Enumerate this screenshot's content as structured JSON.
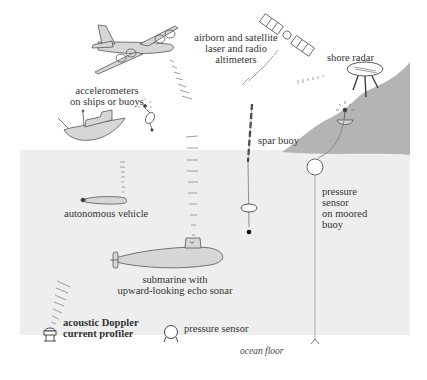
{
  "colors": {
    "ocean": "#eeeeee",
    "land": "#b4b4b4",
    "object_fill": "#d6d6d6",
    "outline": "#555555",
    "text": "#333333"
  },
  "labels": {
    "airborne": "airborn and satellite\nlaser and radio\naltimeters",
    "shore_radar": "shore radar",
    "accelerometers": "accelerometers\non ships or buoys",
    "spar_buoy": "spar buoy",
    "autonomous_vehicle": "autonomous vehicle",
    "pressure_moored": "pressure\nsensor\non moored\nbuoy",
    "submarine": "submarine with\nupward-looking echo sonar",
    "adcp": "acoustic Doppler\ncurrent profiler",
    "pressure_sensor": "pressure sensor",
    "ocean_floor": "ocean floor"
  },
  "objects": [
    {
      "name": "airplane",
      "icon": "airplane-icon"
    },
    {
      "name": "satellite",
      "icon": "satellite-icon"
    },
    {
      "name": "shore-radar",
      "icon": "radar-dish-icon"
    },
    {
      "name": "ship",
      "icon": "ship-icon"
    },
    {
      "name": "small-buoy",
      "icon": "buoy-icon"
    },
    {
      "name": "spar-buoy",
      "icon": "spar-buoy-icon"
    },
    {
      "name": "moored-buoy",
      "icon": "moored-buoy-icon"
    },
    {
      "name": "autonomous-vehicle",
      "icon": "auv-icon"
    },
    {
      "name": "submarine",
      "icon": "submarine-icon"
    },
    {
      "name": "adcp",
      "icon": "adcp-icon"
    },
    {
      "name": "pressure-sensor",
      "icon": "pressure-sensor-icon"
    }
  ]
}
